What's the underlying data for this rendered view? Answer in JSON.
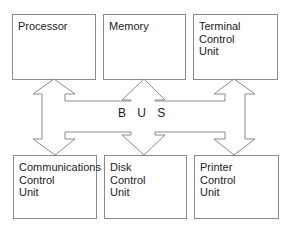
{
  "diagram": {
    "title": "",
    "bus_label": "B U S",
    "top_row": [
      {
        "id": "processor",
        "label": "Processor"
      },
      {
        "id": "memory",
        "label": "Memory"
      },
      {
        "id": "terminal-control-unit",
        "label": "Terminal\nControl\nUnit"
      }
    ],
    "bottom_row": [
      {
        "id": "communications-control-unit",
        "label": "Communications\nControl\nUnit"
      },
      {
        "id": "disk-control-unit",
        "label": "Disk\nControl\nUnit"
      },
      {
        "id": "printer-control-unit",
        "label": "Printer\nControl\nUnit"
      }
    ],
    "connections": [
      {
        "from": "processor",
        "to": "bus",
        "type": "bidirectional"
      },
      {
        "from": "memory",
        "to": "bus",
        "type": "bidirectional"
      },
      {
        "from": "terminal-control-unit",
        "to": "bus",
        "type": "bidirectional"
      },
      {
        "from": "communications-control-unit",
        "to": "bus",
        "type": "bidirectional"
      },
      {
        "from": "disk-control-unit",
        "to": "bus",
        "type": "bidirectional"
      },
      {
        "from": "printer-control-unit",
        "to": "bus",
        "type": "bidirectional"
      }
    ],
    "colors": {
      "stroke": "#8a8a8a",
      "text": "#222222",
      "background": "#ffffff"
    }
  }
}
